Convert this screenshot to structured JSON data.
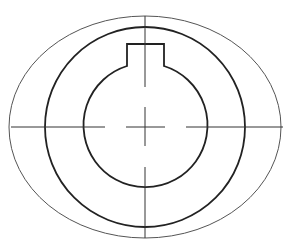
{
  "diagram": {
    "type": "technical-drawing",
    "canvas": {
      "width": 296,
      "height": 249,
      "background": "#ffffff"
    },
    "center": {
      "x": 145,
      "y": 127
    },
    "outer_ellipse": {
      "rx": 136,
      "ry": 111,
      "stroke": "#555555"
    },
    "middle_circle": {
      "r": 100,
      "stroke": "#222222"
    },
    "bore_circle": {
      "r": 62,
      "stroke": "#222222"
    },
    "keyway": {
      "left_x": 127,
      "right_x": 164,
      "top_y": 44,
      "meet_y": 66
    },
    "centerlines": {
      "horizontal_extent": [
        11,
        283
      ],
      "vertical_extent": [
        16,
        238
      ]
    }
  }
}
